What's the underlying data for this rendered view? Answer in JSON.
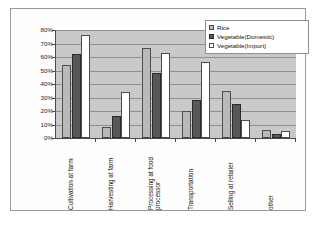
{
  "chart_data": {
    "type": "bar",
    "title": "",
    "xlabel": "",
    "ylabel": "",
    "ylim": [
      0,
      80
    ],
    "ytick_labels": [
      "80%",
      "70%",
      "60%",
      "50%",
      "40%",
      "30%",
      "20%",
      "10%",
      "0%"
    ],
    "ytick_values": [
      80,
      70,
      60,
      50,
      40,
      30,
      20,
      10,
      0
    ],
    "grid": true,
    "legend_position": "top-right",
    "categories": [
      "Cultivation at farm",
      "Harvesting at farm",
      "Processing at food\nprocessor",
      "Transportation",
      "Selling at retailer",
      "other"
    ],
    "series": [
      {
        "name": "Rice",
        "color": "#b9b9b9",
        "values": [
          54,
          8,
          67,
          20,
          35,
          6
        ]
      },
      {
        "name": "Vegetable(Domestic)",
        "color": "#585858",
        "values": [
          62,
          16,
          48,
          28,
          25,
          3
        ]
      },
      {
        "name": "Vegetable(Import)",
        "color": "#ffffff",
        "values": [
          76,
          34,
          63,
          56,
          13,
          5
        ]
      }
    ]
  },
  "colors": {
    "plot_background": "#c9c9c9",
    "axis": "#4a4a4a",
    "gridline": "#8e8e8e",
    "frame": "#9a9a9a"
  }
}
